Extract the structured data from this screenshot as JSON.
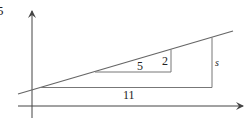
{
  "figure": {
    "corner_label": "5",
    "small_triangle": {
      "run_label": "5",
      "rise_label": "2"
    },
    "large_triangle": {
      "run_label": "11",
      "rise_label": "s"
    },
    "colors": {
      "line": "#666666",
      "axis": "#444444",
      "text": "#222222"
    }
  }
}
